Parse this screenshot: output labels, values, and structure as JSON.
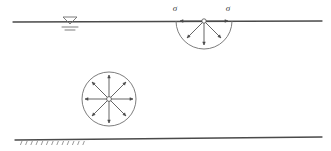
{
  "figure": {
    "background_color": "#ffffff",
    "line_color": "#6e6e6e",
    "dark_line_color": "#4a4a4a",
    "label_color": "#3a3a3a",
    "width": 331,
    "height": 151
  },
  "ground_surface": {
    "name": "ground-surface-line",
    "x1": 13,
    "y1": 22,
    "x2": 322,
    "y2": 21,
    "stroke_width": 1.3
  },
  "bedrock_surface": {
    "name": "lower-boundary-line",
    "x1": 15,
    "y1": 140,
    "x2": 322,
    "y2": 137,
    "stroke_width": 1.3,
    "hatch": {
      "count": 13,
      "start_x": 22,
      "spacing": 5.2,
      "y_top": 141,
      "length": 4,
      "angle_dx": -1.6
    }
  },
  "water_table": {
    "name": "water-table-symbol",
    "triangle": {
      "apex_x": 70,
      "apex_y": 24,
      "left_x": 63,
      "right_x": 77,
      "top_y": 17
    },
    "dashes": [
      {
        "x1": 62,
        "x2": 78,
        "y": 27
      },
      {
        "x1": 65,
        "x2": 75,
        "y": 30
      }
    ]
  },
  "surface_rosette": {
    "name": "semicircular-stress-rosette",
    "center_x": 204,
    "center_y": 21,
    "radius": 28,
    "hub_radius": 2.2,
    "arrow_length": 24,
    "arrow_head": 3.4,
    "arrows": [
      {
        "name": "arrow-left",
        "angle_deg": 180,
        "direction": "outward"
      },
      {
        "name": "arrow-lower-left",
        "angle_deg": 135,
        "direction": "outward"
      },
      {
        "name": "arrow-down",
        "angle_deg": 90,
        "direction": "outward"
      },
      {
        "name": "arrow-lower-right",
        "angle_deg": 45,
        "direction": "outward"
      },
      {
        "name": "arrow-right",
        "angle_deg": 0,
        "direction": "outward"
      }
    ],
    "labels": [
      {
        "name": "sigma-label-left",
        "text": "σ",
        "x": 175,
        "y": 11
      },
      {
        "name": "sigma-label-right",
        "text": "σ",
        "x": 228,
        "y": 11
      }
    ]
  },
  "buried_rosette": {
    "name": "circular-stress-rosette",
    "center_x": 109,
    "center_y": 99,
    "radius": 27,
    "hub_radius": 2.4,
    "arrow_length": 24,
    "arrow_head": 3.4,
    "arrows": [
      {
        "name": "arrow-right",
        "angle_deg": 0
      },
      {
        "name": "arrow-upper-right",
        "angle_deg": 45
      },
      {
        "name": "arrow-up",
        "angle_deg": 90
      },
      {
        "name": "arrow-upper-left",
        "angle_deg": 135
      },
      {
        "name": "arrow-left",
        "angle_deg": 180
      },
      {
        "name": "arrow-lower-left",
        "angle_deg": 225
      },
      {
        "name": "arrow-down",
        "angle_deg": 270
      },
      {
        "name": "arrow-lower-right",
        "angle_deg": 315
      }
    ]
  }
}
